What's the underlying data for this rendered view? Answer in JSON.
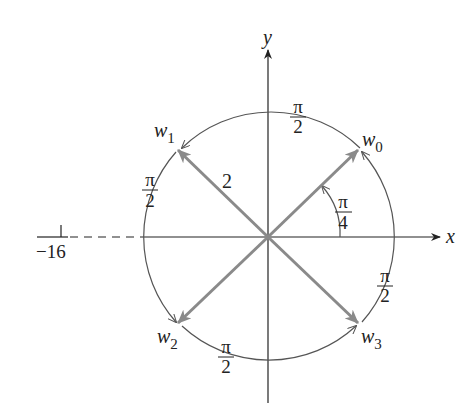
{
  "diagram": {
    "type": "complex-plane-roots",
    "axes": {
      "x_label": "x",
      "y_label": "y",
      "tick_label": "−16"
    },
    "radius_label": "2",
    "roots": [
      {
        "name": "w",
        "sub": "0"
      },
      {
        "name": "w",
        "sub": "1"
      },
      {
        "name": "w",
        "sub": "2"
      },
      {
        "name": "w",
        "sub": "3"
      }
    ],
    "angle_label": {
      "num": "π",
      "den": "4"
    },
    "arc_labels": [
      {
        "num": "π",
        "den": "2"
      },
      {
        "num": "π",
        "den": "2"
      },
      {
        "num": "π",
        "den": "2"
      },
      {
        "num": "π",
        "den": "2"
      }
    ],
    "colors": {
      "axis": "#222222",
      "vector": "#8a8a8a",
      "arc": "#555555"
    }
  }
}
